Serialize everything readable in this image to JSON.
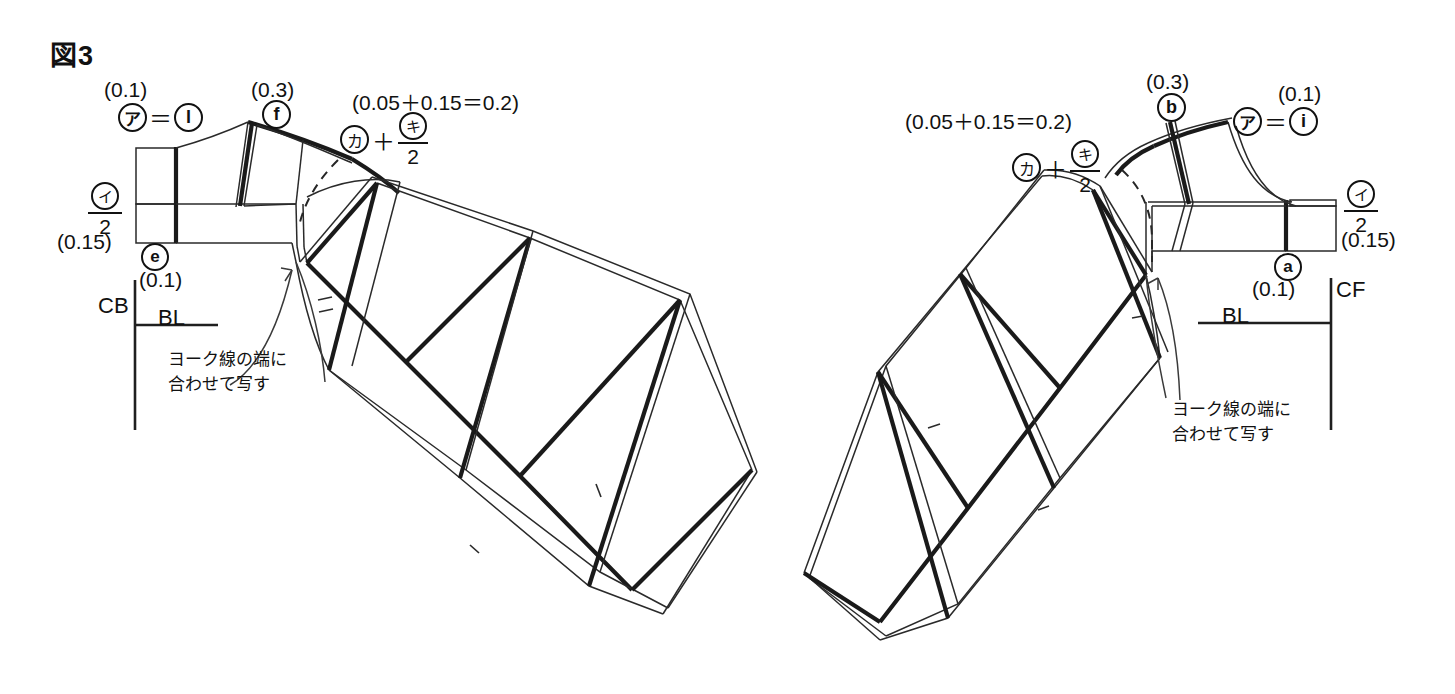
{
  "figure": {
    "title": "図3"
  },
  "annotations": {
    "callout_text_line1": "ヨーク線の端に",
    "callout_text_line2": "合わせて写す",
    "formula_sum": "(0.05＋0.15＝0.2)",
    "frac_numerator_ka": "カ",
    "frac_plus": "＋",
    "frac_top_ki": "キ",
    "frac_bottom_2": "2",
    "i_over_2_top": "イ",
    "i_over_2_bottom": "2",
    "val_0_1": "(0.1)",
    "val_0_3": "(0.3)",
    "val_0_15": "(0.15)",
    "eq_sign": "＝",
    "mark_a_jp": "ア"
  },
  "left_panel": {
    "name": "後ろ身頃側（CB）",
    "label_cb": "CB",
    "label_bl": "BL",
    "marks": [
      {
        "id": "mark-l",
        "glyph": "l",
        "paren": "(0.1)",
        "prefix": "ア＝"
      },
      {
        "id": "mark-f",
        "glyph": "f",
        "paren": "(0.3)",
        "prefix": ""
      },
      {
        "id": "mark-e",
        "glyph": "e",
        "paren": "(0.1)",
        "prefix": ""
      }
    ],
    "formula_top": "(0.05＋0.15＝0.2)",
    "half_label_top": "イ",
    "half_label_bottom": "2",
    "half_paren": "(0.15)"
  },
  "right_panel": {
    "name": "前身頃側（CF）",
    "label_cf": "CF",
    "label_bl": "BL",
    "marks": [
      {
        "id": "mark-b",
        "glyph": "b",
        "paren": "(0.3)",
        "prefix": ""
      },
      {
        "id": "mark-i",
        "glyph": "i",
        "paren": "(0.1)",
        "prefix": "ア＝"
      },
      {
        "id": "mark-a",
        "glyph": "a",
        "paren": "(0.1)",
        "prefix": ""
      }
    ],
    "formula_top": "(0.05＋0.15＝0.2)",
    "half_label_top": "イ",
    "half_label_bottom": "2",
    "half_paren": "(0.15)"
  },
  "colors": {
    "ink": "#111111",
    "paper": "#ffffff",
    "thin_ink": "#3a3a3a"
  }
}
